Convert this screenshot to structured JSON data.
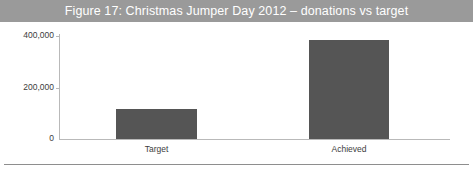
{
  "figure": {
    "title": "Figure 17: Christmas Jumper Day 2012 – donations vs target",
    "title_band_color": "#9a9a9a",
    "title_text_color": "#ffffff",
    "bar_color": "#555555",
    "axis_color": "#b9b9b9",
    "rule_color": "#8e8e8e"
  },
  "chart_data": {
    "type": "bar",
    "title": "Figure 17: Christmas Jumper Day 2012 – donations vs target",
    "xlabel": "",
    "ylabel": "",
    "categories": [
      "Target",
      "Achieved"
    ],
    "values": [
      116000,
      384000
    ],
    "ylim": [
      0,
      400000
    ],
    "yticks": [
      0,
      200000,
      400000
    ],
    "ytick_labels": [
      "0",
      "200,000",
      "400,000"
    ],
    "grid": false,
    "legend": false,
    "series": [
      {
        "name": "Donations",
        "values": [
          116000,
          384000
        ],
        "color": "#555555"
      }
    ]
  }
}
